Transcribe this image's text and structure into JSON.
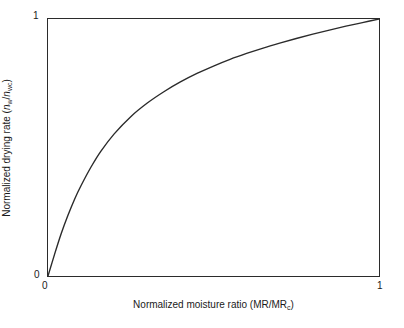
{
  "chart_data": {
    "type": "line",
    "title": "",
    "subtitle": "",
    "xlabel_plain": "Normalized moisture ratio (MR/MRc)",
    "ylabel_plain": "Normalized drying rate (nw/nwc)",
    "xlabel_parts": {
      "lead": "Normalized moisture ratio (MR/MR",
      "sub": "c",
      "tail": ")"
    },
    "ylabel_parts": {
      "lead": "Normalized drying rate (",
      "num_sym": "n",
      "num_sub": "w",
      "slash": "/",
      "den_sym": "n",
      "den_sub": "wc",
      "tail": ")"
    },
    "xlim": [
      0,
      1
    ],
    "ylim": [
      0,
      1
    ],
    "xticks": [
      0,
      1
    ],
    "yticks": [
      0,
      1
    ],
    "xtick_labels": [
      "0",
      "1"
    ],
    "ytick_labels": [
      "0",
      "1"
    ],
    "grid": false,
    "legend": null,
    "legend_position": "none",
    "annotations": [],
    "line_color": "#2b2b2b",
    "frame_color": "#2b2b2b",
    "background_color": "#ffffff",
    "series": [
      {
        "name": "normalized drying rate curve",
        "x": [
          0.0,
          0.02,
          0.04,
          0.06,
          0.08,
          0.1,
          0.13,
          0.16,
          0.2,
          0.25,
          0.3,
          0.35,
          0.4,
          0.45,
          0.5,
          0.55,
          0.6,
          0.65,
          0.7,
          0.75,
          0.8,
          0.85,
          0.9,
          0.95,
          1.0
        ],
        "y": [
          0.0,
          0.085,
          0.165,
          0.235,
          0.298,
          0.352,
          0.424,
          0.486,
          0.553,
          0.62,
          0.673,
          0.717,
          0.755,
          0.788,
          0.817,
          0.843,
          0.866,
          0.887,
          0.906,
          0.924,
          0.941,
          0.957,
          0.972,
          0.986,
          1.0
        ]
      }
    ]
  },
  "ticks": {
    "y_top": "1",
    "y_bottom": "0",
    "x_left": "0",
    "x_right": "1"
  }
}
